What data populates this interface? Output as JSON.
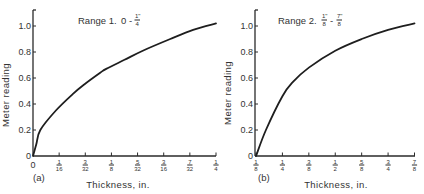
{
  "chart_data": [
    {
      "type": "line",
      "panel_label": "(a)",
      "title": "Range 1.  0 - 1\"/4",
      "title_parts": {
        "prefix": "Range 1.",
        "from": "0",
        "to_num": "1\"",
        "to_den": "4"
      },
      "xlabel": "Thickness, in.",
      "ylabel": "Meter reading",
      "ylim": [
        0,
        1.0
      ],
      "yticks": [
        "0",
        "0.2",
        "0.4",
        "0.6",
        "0.8",
        "1.0"
      ],
      "xticks": [
        {
          "num": "0",
          "den": ""
        },
        {
          "num": "1",
          "den": "16"
        },
        {
          "num": "3",
          "den": "32"
        },
        {
          "num": "1",
          "den": "8"
        },
        {
          "num": "5",
          "den": "32"
        },
        {
          "num": "3",
          "den": "16"
        },
        {
          "num": "7",
          "den": "32"
        },
        {
          "num": "1",
          "den": "4"
        }
      ],
      "xlim": [
        0,
        0.25
      ],
      "grid": false,
      "series": [
        {
          "name": "Range 1",
          "x": [
            0,
            0.0045,
            0.01,
            0.03125,
            0.055,
            0.07,
            0.0918,
            0.1,
            0.125,
            0.15,
            0.1875,
            0.21875,
            0.25
          ],
          "y": [
            0,
            0.09,
            0.2,
            0.35,
            0.48,
            0.55,
            0.64,
            0.67,
            0.74,
            0.81,
            0.9,
            0.97,
            1.02
          ]
        }
      ]
    },
    {
      "type": "line",
      "panel_label": "(b)",
      "title": "Range 2.  1\"/8 - 7\"/8",
      "title_parts": {
        "prefix": "Range 2.",
        "from_num": "1\"",
        "from_den": "8",
        "to_num": "7\"",
        "to_den": "8"
      },
      "xlabel": "Thickness, in.",
      "ylabel": "Meter reading",
      "ylim": [
        0,
        1.0
      ],
      "yticks": [
        "0",
        "0.2",
        "0.4",
        "0.6",
        "0.8",
        "1.0"
      ],
      "xticks": [
        {
          "num": "1",
          "den": "8"
        },
        {
          "num": "1",
          "den": "4"
        },
        {
          "num": "3",
          "den": "8"
        },
        {
          "num": "1",
          "den": "2"
        },
        {
          "num": "5",
          "den": "8"
        },
        {
          "num": "3",
          "den": "4"
        },
        {
          "num": "7",
          "den": "8"
        }
      ],
      "xlim": [
        0.125,
        0.875
      ],
      "grid": false,
      "series": [
        {
          "name": "Range 2",
          "x": [
            0.125,
            0.172,
            0.25,
            0.3,
            0.375,
            0.5,
            0.625,
            0.75,
            0.875
          ],
          "y": [
            0,
            0.2,
            0.46,
            0.57,
            0.68,
            0.81,
            0.9,
            0.97,
            1.02
          ]
        }
      ]
    }
  ]
}
